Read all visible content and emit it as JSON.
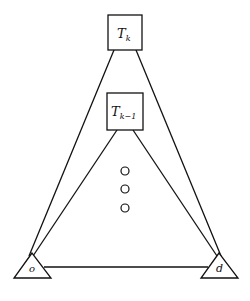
{
  "diagram": {
    "type": "network",
    "nodes": [
      {
        "id": "Tk",
        "shape": "square",
        "label_main": "T",
        "label_sub": "k",
        "x": 108,
        "y": 15,
        "w": 34,
        "h": 35
      },
      {
        "id": "Tk-1",
        "shape": "square",
        "label_main": "T",
        "label_sub": "k−1",
        "x": 107,
        "y": 93,
        "w": 36,
        "h": 37
      },
      {
        "id": "o",
        "shape": "triangle",
        "label": "o"
      },
      {
        "id": "d",
        "shape": "triangle",
        "label": "d"
      }
    ],
    "edges": [
      {
        "from": "o",
        "to": "Tk"
      },
      {
        "from": "o",
        "to": "Tk-1"
      },
      {
        "from": "d",
        "to": "Tk"
      },
      {
        "from": "d",
        "to": "Tk-1"
      },
      {
        "from": "o",
        "to": "d"
      }
    ],
    "ellipsis": {
      "count": 3,
      "marker": "circle"
    }
  },
  "labels": {
    "tk_main": "T",
    "tk_sub": "k",
    "tk1_main": "T",
    "tk1_sub": "k−1",
    "o": "o",
    "d": "d"
  }
}
